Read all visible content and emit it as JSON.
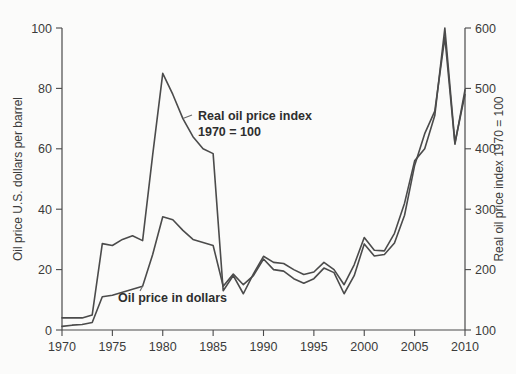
{
  "chart_data": {
    "type": "line",
    "title": "",
    "subtitle": "",
    "xlabel": "",
    "ylabel": "Oil price U.S. dollars per barrel",
    "ylabel_right": "Real oil price index 1970 = 100",
    "grid": false,
    "legend_position": "inline-annotations",
    "xlim": [
      1970,
      2010
    ],
    "ylim": [
      0,
      100
    ],
    "ylim_right": [
      100,
      600
    ],
    "xticks": [
      1970,
      1975,
      1980,
      1985,
      1990,
      1995,
      2000,
      2005,
      2010
    ],
    "xtick_labels": [
      "1970",
      "1975",
      "1980",
      "1985",
      "1990",
      "1995",
      "2000",
      "2005",
      "2010"
    ],
    "yticks": [
      0,
      20,
      40,
      60,
      80,
      100
    ],
    "ytick_labels": [
      "0",
      "20",
      "40",
      "60",
      "80",
      "100"
    ],
    "yticks_right": [
      100,
      200,
      300,
      400,
      500,
      600
    ],
    "ytick_labels_right": [
      "100",
      "200",
      "300",
      "400",
      "500",
      "600"
    ],
    "x": [
      1970,
      1971,
      1972,
      1973,
      1974,
      1975,
      1976,
      1977,
      1978,
      1979,
      1980,
      1981,
      1982,
      1983,
      1984,
      1985,
      1986,
      1987,
      1988,
      1989,
      1990,
      1991,
      1992,
      1993,
      1994,
      1995,
      1996,
      1997,
      1998,
      1999,
      2000,
      2001,
      2002,
      2003,
      2004,
      2005,
      2006,
      2007,
      2008,
      2009,
      2010
    ],
    "series": [
      {
        "name": "Real oil price index 1970 = 100",
        "axis": "right",
        "units": "index, 1970 = 100",
        "values": [
          120,
          120,
          120,
          125,
          243,
          240,
          250,
          256,
          248,
          390,
          525,
          490,
          450,
          420,
          400,
          392,
          165,
          190,
          160,
          193,
          222,
          212,
          210,
          200,
          192,
          196,
          212,
          200,
          175,
          208,
          253,
          232,
          231,
          260,
          310,
          380,
          400,
          455,
          600,
          410,
          490
        ]
      },
      {
        "name": "Oil price in dollars",
        "axis": "left",
        "units": "U.S. dollars per barrel",
        "values": [
          1.2,
          1.6,
          1.8,
          2.5,
          11.0,
          11.5,
          12.5,
          13.5,
          14.5,
          25.0,
          37.5,
          36.5,
          33.0,
          30.0,
          29.0,
          28.0,
          14.5,
          18.5,
          15.0,
          18.0,
          23.5,
          20.0,
          19.5,
          17.0,
          15.5,
          17.0,
          20.5,
          19.0,
          12.0,
          18.0,
          28.5,
          24.5,
          25.0,
          28.8,
          38.0,
          54.5,
          65.0,
          72.5,
          97.0,
          61.5,
          79.5
        ]
      }
    ],
    "annotations": [
      {
        "id": "real-index-annotation",
        "line1": "Real oil price index",
        "line2": "1970 = 100",
        "points_at_year": 1982
      },
      {
        "id": "dollar-price-annotation",
        "line1": "Oil price in dollars",
        "line2": "",
        "points_at_year": 1978
      }
    ]
  }
}
